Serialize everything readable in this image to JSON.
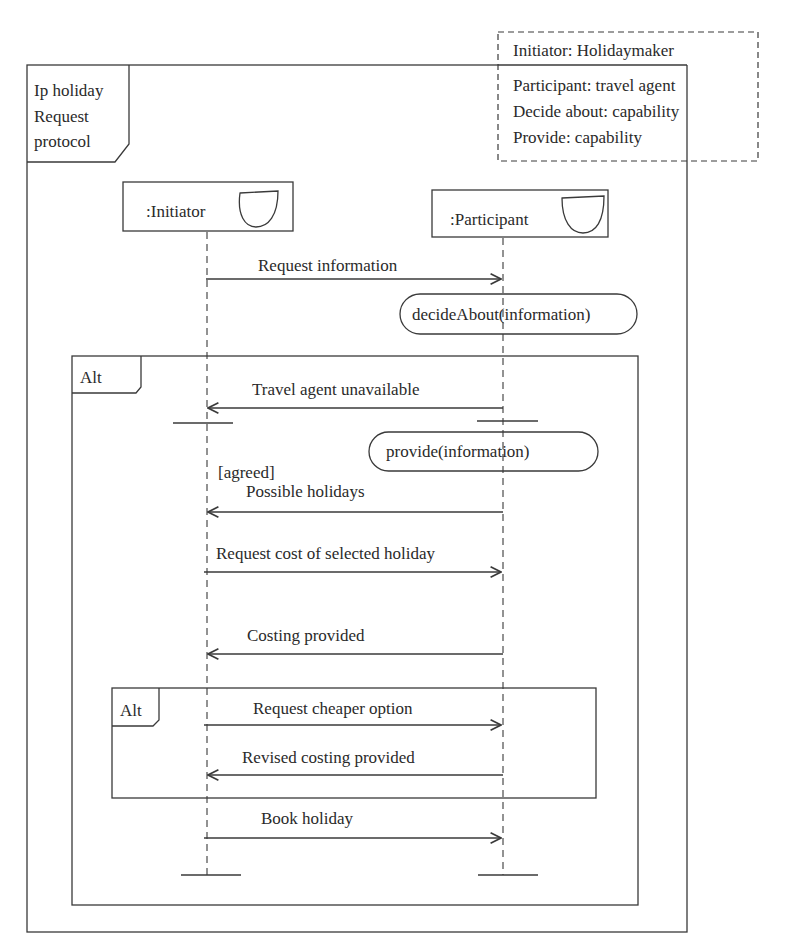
{
  "frame": {
    "title_lines": [
      "Ip holiday",
      "Request",
      "protocol"
    ]
  },
  "note": {
    "lines": [
      "Initiator: Holidaymaker",
      "Participant: travel agent",
      "Decide about: capability",
      "Provide: capability"
    ]
  },
  "lifelines": [
    {
      "label": ":Initiator",
      "icon": "entity-icon"
    },
    {
      "label": ":Participant",
      "icon": "entity-icon"
    }
  ],
  "messages": [
    {
      "label": "Request information",
      "direction": "right"
    },
    {
      "label": "Travel agent unavailable",
      "direction": "left"
    },
    {
      "label": "Possible holidays",
      "direction": "left",
      "guard": "[agreed]"
    },
    {
      "label": "Request cost of selected holiday",
      "direction": "right"
    },
    {
      "label": "Costing provided",
      "direction": "left"
    },
    {
      "label": "Request cheaper option",
      "direction": "right"
    },
    {
      "label": "Revised costing provided",
      "direction": "left"
    },
    {
      "label": "Book holiday",
      "direction": "right"
    }
  ],
  "actions": [
    {
      "label": "decideAbout(information)"
    },
    {
      "label": "provide(information)"
    }
  ],
  "fragments": [
    {
      "operator": "Alt"
    },
    {
      "operator": "Alt"
    }
  ]
}
